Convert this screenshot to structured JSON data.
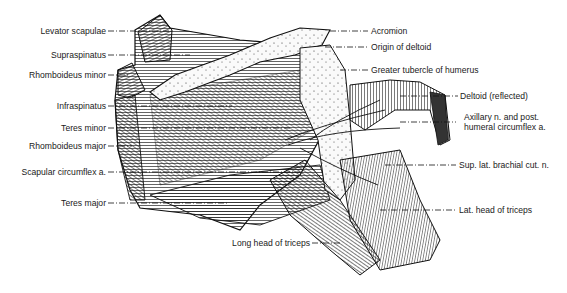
{
  "figure": {
    "ink_color": "#1a1a1a",
    "background": "#ffffff"
  },
  "labels_left": [
    {
      "text": "Levator scapulae",
      "y": 31
    },
    {
      "text": "Supraspinatus",
      "y": 55
    },
    {
      "text": "Rhomboideus minor",
      "y": 75
    },
    {
      "text": "Infraspinatus",
      "y": 106
    },
    {
      "text": "Teres minor",
      "y": 128
    },
    {
      "text": "Rhomboideus major",
      "y": 146
    },
    {
      "text": "Scapular circumflex a.",
      "y": 172
    },
    {
      "text": "Teres major",
      "y": 203
    }
  ],
  "labels_right": [
    {
      "text": "Acromion",
      "y": 31
    },
    {
      "text": "Origin of deltoid",
      "y": 47
    },
    {
      "text": "Greater tubercle of humerus",
      "y": 70
    },
    {
      "text": "Deltoid (reflected)",
      "y": 96
    },
    {
      "text": "Axillary n. and post.",
      "text2": "humeral circumflex a.",
      "y": 117
    },
    {
      "text": "Sup. lat. brachial cut. n.",
      "y": 165
    },
    {
      "text": "Lat. head of triceps",
      "y": 210
    }
  ],
  "labels_bottom": [
    {
      "text": "Long head of triceps",
      "y": 243
    }
  ]
}
